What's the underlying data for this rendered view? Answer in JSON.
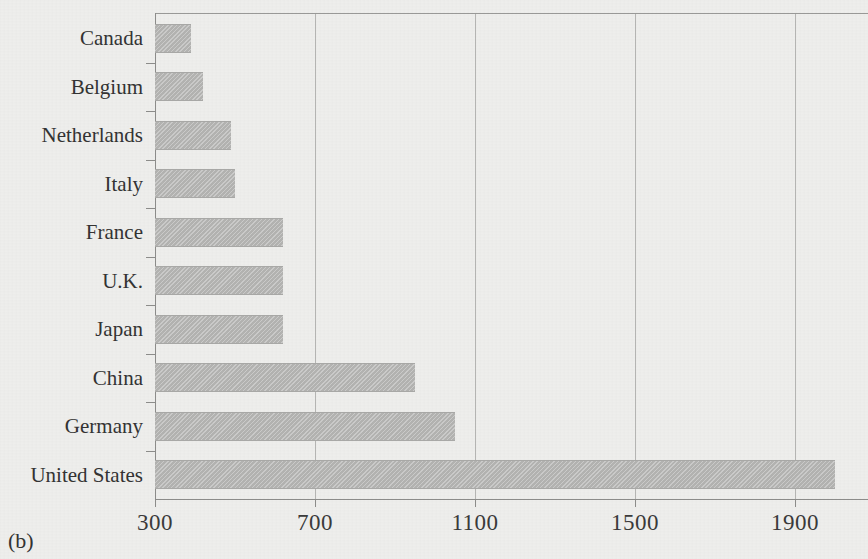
{
  "figure": {
    "panel_label": "(b)"
  },
  "chart_data": {
    "type": "bar",
    "orientation": "horizontal",
    "title": "",
    "subtitle": "",
    "xlabel": "",
    "ylabel": "",
    "categories": [
      "Canada",
      "Belgium",
      "Netherlands",
      "Italy",
      "France",
      "U.K.",
      "Japan",
      "China",
      "Germany",
      "United States"
    ],
    "values": [
      390,
      420,
      490,
      500,
      620,
      620,
      620,
      950,
      1050,
      2000
    ],
    "xlim": [
      300,
      2100
    ],
    "xticks": [
      300,
      700,
      1100,
      1500,
      1900
    ],
    "xticklabels": [
      "300",
      "700",
      "1100",
      "1500",
      "1900"
    ],
    "grid": "vertical",
    "legend": "none",
    "bar_color": "#b3b3b1",
    "axis_color": "#8d8d8b",
    "gridline_color": "#b6b6b4",
    "background_color": "#eeeeec"
  }
}
